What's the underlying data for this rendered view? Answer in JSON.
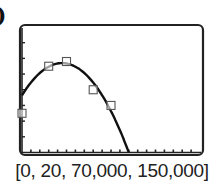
{
  "part_label": ")",
  "window_label": "[0, 20, 70,000, 150,000]",
  "chart_data": {
    "type": "scatter",
    "title": "",
    "xlabel": "",
    "ylabel": "",
    "xlim": [
      0,
      20
    ],
    "ylim": [
      70000,
      150000
    ],
    "x_tick_step": 1,
    "y_tick_step": 10000,
    "grid": false,
    "legend": null,
    "series": [
      {
        "name": "data",
        "kind": "scatter",
        "marker": "square-open",
        "x": [
          0,
          3,
          5,
          8,
          10
        ],
        "y": [
          95000,
          125000,
          128000,
          110000,
          100000
        ]
      },
      {
        "name": "quadratic-fit",
        "kind": "line",
        "peak": [
          4.5,
          127000
        ],
        "x_intercept": 12
      }
    ]
  }
}
